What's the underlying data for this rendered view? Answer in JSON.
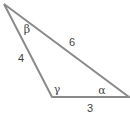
{
  "diagram": {
    "type": "triangle",
    "stroke_color": "#8a8a8a",
    "text_color": "#444444",
    "vertices": {
      "top": [
        4,
        4
      ],
      "bottom_left": [
        52,
        97
      ],
      "bottom_right": [
        129,
        97
      ]
    },
    "sides": {
      "left": "4",
      "hypotenuse": "6",
      "bottom": "3"
    },
    "angles": {
      "top": "β",
      "bottom_left": "γ",
      "bottom_right": "α"
    }
  }
}
